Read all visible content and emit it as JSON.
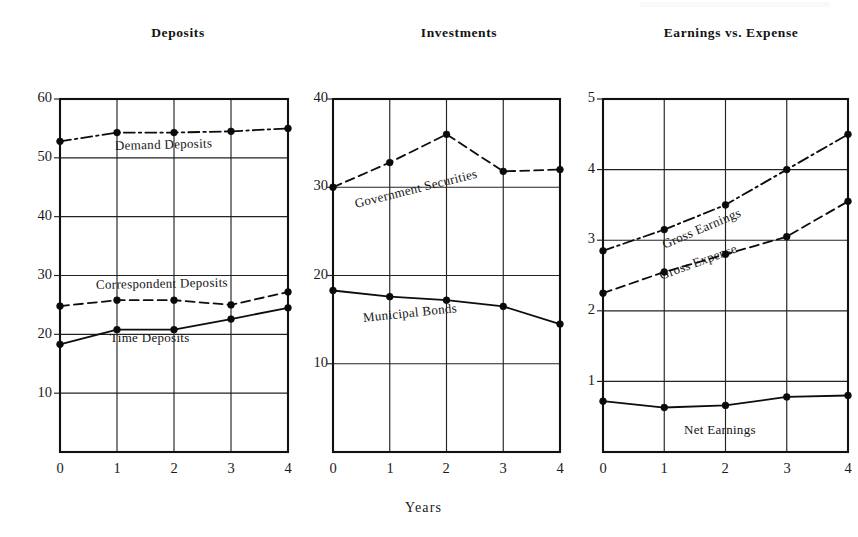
{
  "figure": {
    "shared_xlabel": "Years",
    "background": "#ffffff",
    "ink_color": "#0d0d0d"
  },
  "chart_data": [
    {
      "type": "line",
      "title": "Deposits",
      "xlabel": "Years",
      "ylabel": "",
      "x": [
        0,
        1,
        2,
        3,
        4
      ],
      "xticklabels": [
        "0",
        "1",
        "2",
        "3",
        "4"
      ],
      "xlim": [
        0,
        4
      ],
      "ylim": [
        0,
        60
      ],
      "yticks": [
        10,
        20,
        30,
        40,
        50,
        60
      ],
      "yticklabels": [
        "10",
        "20",
        "30",
        "40",
        "50",
        "60"
      ],
      "grid": true,
      "legend": "inline-on-curve",
      "series": [
        {
          "name": "Demand Deposits",
          "style": "dashdot",
          "values": [
            52.8,
            54.3,
            54.3,
            54.5,
            55.0
          ],
          "label_angle": -2
        },
        {
          "name": "Correspondent Deposits",
          "style": "dashed",
          "values": [
            24.8,
            25.8,
            25.8,
            25.0,
            27.2
          ],
          "label_angle": -1
        },
        {
          "name": "Time Deposits",
          "style": "solid",
          "values": [
            18.3,
            20.8,
            20.8,
            22.6,
            24.5
          ],
          "label_angle": 0
        }
      ]
    },
    {
      "type": "line",
      "title": "Investments",
      "xlabel": "Years",
      "ylabel": "",
      "x": [
        0,
        1,
        2,
        3,
        4
      ],
      "xticklabels": [
        "0",
        "1",
        "2",
        "3",
        "4"
      ],
      "xlim": [
        0,
        4
      ],
      "ylim": [
        0,
        40
      ],
      "yticks": [
        10,
        20,
        30,
        40
      ],
      "yticklabels": [
        "10",
        "20",
        "30",
        "40"
      ],
      "grid": true,
      "legend": "inline-on-curve",
      "series": [
        {
          "name": "Government Securities",
          "style": "dashed",
          "values": [
            30.0,
            32.8,
            36.0,
            31.8,
            32.0
          ],
          "label_angle": -14
        },
        {
          "name": "Municipal Bonds",
          "style": "solid",
          "values": [
            18.3,
            17.6,
            17.2,
            16.5,
            14.5
          ],
          "label_angle": -6
        }
      ]
    },
    {
      "type": "line",
      "title": "Earnings vs. Expense",
      "xlabel": "Years",
      "ylabel": "",
      "x": [
        0,
        1,
        2,
        3,
        4
      ],
      "xticklabels": [
        "0",
        "1",
        "2",
        "3",
        "4"
      ],
      "xlim": [
        0,
        4
      ],
      "ylim": [
        0,
        5
      ],
      "yticks": [
        1,
        2,
        3,
        4,
        5
      ],
      "yticklabels": [
        "1",
        "2",
        "3",
        "4",
        "5"
      ],
      "grid": true,
      "legend": "inline-on-curve",
      "series": [
        {
          "name": "Gross Earnings",
          "style": "dashdot",
          "values": [
            2.85,
            3.15,
            3.5,
            4.0,
            4.5
          ],
          "label_angle": -22
        },
        {
          "name": "Gross Expense",
          "style": "dashed",
          "values": [
            2.25,
            2.55,
            2.8,
            3.05,
            3.55
          ],
          "label_angle": -20
        },
        {
          "name": "Net Earnings",
          "style": "solid",
          "values": [
            0.72,
            0.63,
            0.66,
            0.78,
            0.8
          ],
          "label_angle": 0
        }
      ]
    }
  ]
}
